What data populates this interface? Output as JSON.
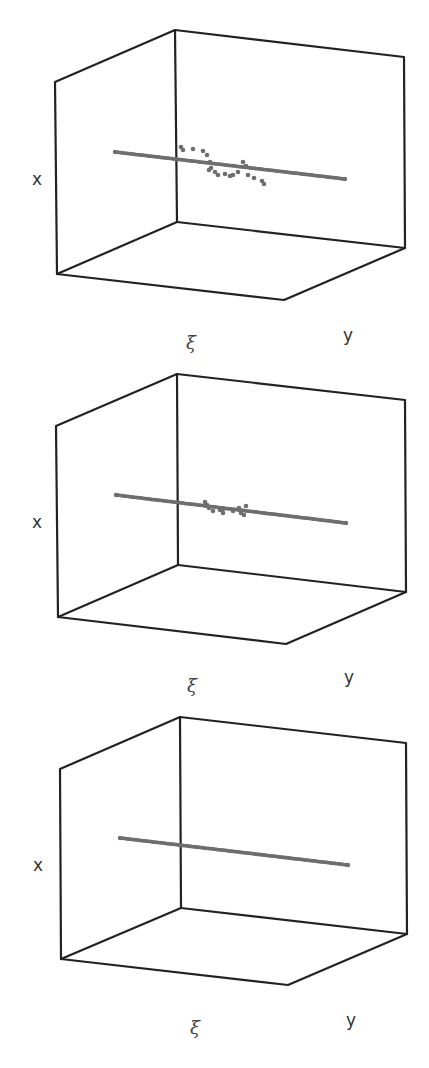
{
  "figure": {
    "panels": [
      {
        "id": "top",
        "x_label": "x",
        "xi_label": "ξ",
        "y_label": "y"
      },
      {
        "id": "middle",
        "x_label": "x",
        "xi_label": "ξ",
        "y_label": "y"
      },
      {
        "id": "bottom",
        "x_label": "x",
        "xi_label": "ξ",
        "y_label": "y"
      }
    ],
    "colors": {
      "box": "#222222",
      "points": "#6e6e6e",
      "labels": "#333333"
    }
  },
  "chart_data": [
    {
      "type": "scatter",
      "title": "",
      "projection": "3d",
      "axes": {
        "vertical": "x",
        "depth": "ξ",
        "horizontal": "y"
      },
      "grid": false,
      "legend": null,
      "description": "Straight line of points with a wavy perturbation near the middle (largest deviation)",
      "line_pixels": {
        "start": [
          115,
          152
        ],
        "end": [
          345,
          179
        ]
      },
      "perturbation_pixels": [
        [
          181,
          147
        ],
        [
          183,
          150
        ],
        [
          193,
          149
        ],
        [
          203,
          151
        ],
        [
          207,
          155
        ],
        [
          210,
          162
        ],
        [
          211,
          168
        ],
        [
          209,
          170
        ],
        [
          215,
          172
        ],
        [
          218,
          175
        ],
        [
          225,
          174
        ],
        [
          230,
          176
        ],
        [
          233,
          175
        ],
        [
          238,
          172
        ],
        [
          243,
          162
        ],
        [
          246,
          166
        ],
        [
          248,
          175
        ],
        [
          254,
          178
        ],
        [
          262,
          181
        ],
        [
          264,
          184
        ]
      ]
    },
    {
      "type": "scatter",
      "title": "",
      "projection": "3d",
      "axes": {
        "vertical": "x",
        "depth": "ξ",
        "horizontal": "y"
      },
      "grid": false,
      "legend": null,
      "description": "Straight line of points with a small perturbation near the middle",
      "line_pixels": {
        "start": [
          116,
          495
        ],
        "end": [
          346,
          523
        ]
      },
      "perturbation_pixels": [
        [
          205,
          502
        ],
        [
          207,
          505
        ],
        [
          209,
          508
        ],
        [
          213,
          511
        ],
        [
          220,
          510
        ],
        [
          223,
          509
        ],
        [
          223,
          513
        ],
        [
          233,
          511
        ],
        [
          239,
          508
        ],
        [
          241,
          513
        ],
        [
          244,
          515
        ],
        [
          246,
          506
        ]
      ]
    },
    {
      "type": "scatter",
      "title": "",
      "projection": "3d",
      "axes": {
        "vertical": "x",
        "depth": "ξ",
        "horizontal": "y"
      },
      "grid": false,
      "legend": null,
      "description": "Straight line of points, no perturbation",
      "line_pixels": {
        "start": [
          120,
          838
        ],
        "end": [
          348,
          865
        ]
      },
      "perturbation_pixels": []
    }
  ]
}
